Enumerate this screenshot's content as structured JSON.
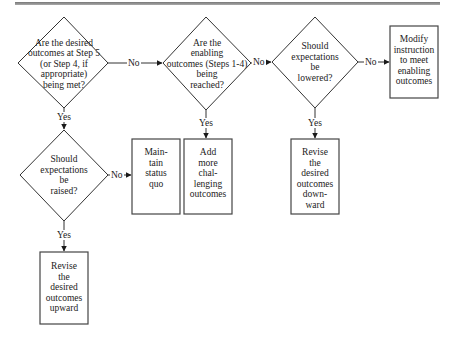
{
  "diagram": {
    "type": "flowchart",
    "decisions": [
      {
        "id": "d1",
        "text": "Are the desired\noutcomes at Step 5\n(or Step 4, if\nappropriate)\nbeing met?"
      },
      {
        "id": "d2",
        "text": "Are the\nenabling\noutcomes (Steps 1-4)\nbeing\nreached?"
      },
      {
        "id": "d3",
        "text": "Should\nexpectations\nbe\nlowered?"
      },
      {
        "id": "d4",
        "text": "Should\nexpectations\nbe\nraised?"
      }
    ],
    "actions": [
      {
        "id": "a1",
        "text": "Modify\ninstruction\nto meet\nenabling\noutcomes"
      },
      {
        "id": "a2",
        "text": "Main-\ntain\nstatus\nquo"
      },
      {
        "id": "a3",
        "text": "Add\nmore\nchal-\nlenging\noutcomes"
      },
      {
        "id": "a4",
        "text": "Revise\nthe\ndesired\noutcomes\ndown-\nward"
      },
      {
        "id": "a5",
        "text": "Revise\nthe\ndesired\noutcomes\nupward"
      }
    ],
    "edges": [
      {
        "from": "d1",
        "to": "d2",
        "label": "No"
      },
      {
        "from": "d2",
        "to": "d3",
        "label": "No"
      },
      {
        "from": "d3",
        "to": "a1",
        "label": "No"
      },
      {
        "from": "d1",
        "to": "d4",
        "label": "Yes"
      },
      {
        "from": "d2",
        "to": "a3",
        "label": "Yes"
      },
      {
        "from": "d3",
        "to": "a4",
        "label": "Yes"
      },
      {
        "from": "d4",
        "to": "a2",
        "label": "No"
      },
      {
        "from": "d4",
        "to": "a5",
        "label": "Yes"
      }
    ]
  }
}
